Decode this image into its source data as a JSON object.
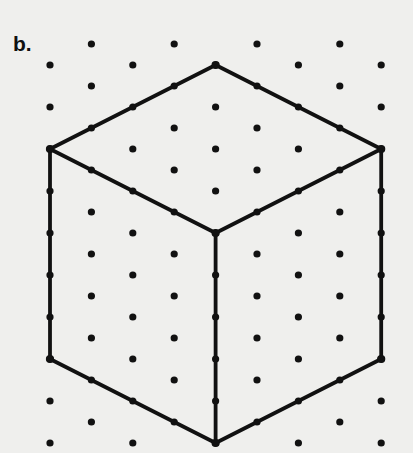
{
  "figure": {
    "panel_label": "b.",
    "caption_text": "",
    "background_color": "#efefed",
    "ink_color": "#111111",
    "dot_color": "#111111",
    "dot_radius": 3.6,
    "line_width": 3.8,
    "width": 413,
    "height": 453
  },
  "grid": {
    "type": "isometric-dot-lattice",
    "col_spacing": 82.8,
    "row_spacing": 42.0,
    "row_offset_even": 50,
    "row_offset_odd": 91.4,
    "first_row_y": 44,
    "row_count": 10,
    "cols_per_row": 5,
    "dots": [
      {
        "x": 91.4,
        "y": 44
      },
      {
        "x": 174.2,
        "y": 44
      },
      {
        "x": 257.0,
        "y": 44
      },
      {
        "x": 339.8,
        "y": 44
      },
      {
        "x": 50.0,
        "y": 65
      },
      {
        "x": 132.8,
        "y": 65
      },
      {
        "x": 215.6,
        "y": 65
      },
      {
        "x": 298.4,
        "y": 65
      },
      {
        "x": 381.2,
        "y": 65
      },
      {
        "x": 91.4,
        "y": 86
      },
      {
        "x": 174.2,
        "y": 86
      },
      {
        "x": 257.0,
        "y": 86
      },
      {
        "x": 339.8,
        "y": 86
      },
      {
        "x": 50.0,
        "y": 107
      },
      {
        "x": 132.8,
        "y": 107
      },
      {
        "x": 215.6,
        "y": 107
      },
      {
        "x": 298.4,
        "y": 107
      },
      {
        "x": 381.2,
        "y": 107
      },
      {
        "x": 91.4,
        "y": 128
      },
      {
        "x": 174.2,
        "y": 128
      },
      {
        "x": 257.0,
        "y": 128
      },
      {
        "x": 339.8,
        "y": 128
      },
      {
        "x": 50.0,
        "y": 149
      },
      {
        "x": 132.8,
        "y": 149
      },
      {
        "x": 215.6,
        "y": 149
      },
      {
        "x": 298.4,
        "y": 149
      },
      {
        "x": 381.2,
        "y": 149
      },
      {
        "x": 91.4,
        "y": 170
      },
      {
        "x": 174.2,
        "y": 170
      },
      {
        "x": 257.0,
        "y": 170
      },
      {
        "x": 339.8,
        "y": 170
      },
      {
        "x": 50.0,
        "y": 191
      },
      {
        "x": 132.8,
        "y": 191
      },
      {
        "x": 215.6,
        "y": 191
      },
      {
        "x": 298.4,
        "y": 191
      },
      {
        "x": 381.2,
        "y": 191
      },
      {
        "x": 91.4,
        "y": 212
      },
      {
        "x": 174.2,
        "y": 212
      },
      {
        "x": 257.0,
        "y": 212
      },
      {
        "x": 339.8,
        "y": 212
      },
      {
        "x": 50.0,
        "y": 233
      },
      {
        "x": 132.8,
        "y": 233
      },
      {
        "x": 215.6,
        "y": 233
      },
      {
        "x": 298.4,
        "y": 233
      },
      {
        "x": 381.2,
        "y": 233
      },
      {
        "x": 91.4,
        "y": 254
      },
      {
        "x": 174.2,
        "y": 254
      },
      {
        "x": 257.0,
        "y": 254
      },
      {
        "x": 339.8,
        "y": 254
      },
      {
        "x": 50.0,
        "y": 275
      },
      {
        "x": 132.8,
        "y": 275
      },
      {
        "x": 215.6,
        "y": 275
      },
      {
        "x": 298.4,
        "y": 275
      },
      {
        "x": 381.2,
        "y": 275
      },
      {
        "x": 91.4,
        "y": 296
      },
      {
        "x": 174.2,
        "y": 296
      },
      {
        "x": 257.0,
        "y": 296
      },
      {
        "x": 339.8,
        "y": 296
      },
      {
        "x": 50.0,
        "y": 317
      },
      {
        "x": 132.8,
        "y": 317
      },
      {
        "x": 215.6,
        "y": 317
      },
      {
        "x": 298.4,
        "y": 317
      },
      {
        "x": 381.2,
        "y": 317
      },
      {
        "x": 91.4,
        "y": 338
      },
      {
        "x": 174.2,
        "y": 338
      },
      {
        "x": 257.0,
        "y": 338
      },
      {
        "x": 339.8,
        "y": 338
      },
      {
        "x": 50.0,
        "y": 359
      },
      {
        "x": 132.8,
        "y": 359
      },
      {
        "x": 215.6,
        "y": 359
      },
      {
        "x": 298.4,
        "y": 359
      },
      {
        "x": 381.2,
        "y": 359
      },
      {
        "x": 91.4,
        "y": 380
      },
      {
        "x": 174.2,
        "y": 380
      },
      {
        "x": 257.0,
        "y": 380
      },
      {
        "x": 339.8,
        "y": 380
      },
      {
        "x": 50.0,
        "y": 401
      },
      {
        "x": 132.8,
        "y": 401
      },
      {
        "x": 215.6,
        "y": 401
      },
      {
        "x": 298.4,
        "y": 401
      },
      {
        "x": 381.2,
        "y": 401
      },
      {
        "x": 91.4,
        "y": 422
      },
      {
        "x": 174.2,
        "y": 422
      },
      {
        "x": 257.0,
        "y": 422
      },
      {
        "x": 339.8,
        "y": 422
      },
      {
        "x": 50.0,
        "y": 443
      },
      {
        "x": 132.8,
        "y": 443
      },
      {
        "x": 215.6,
        "y": 443
      },
      {
        "x": 298.4,
        "y": 443
      },
      {
        "x": 381.2,
        "y": 443
      }
    ]
  },
  "drawing": {
    "shape_name": "isometric-cube",
    "vertices": {
      "top": {
        "x": 215.6,
        "y": 65
      },
      "left": {
        "x": 50.0,
        "y": 149
      },
      "right": {
        "x": 381.2,
        "y": 149
      },
      "center": {
        "x": 215.6,
        "y": 233
      },
      "bottom_left": {
        "x": 50.0,
        "y": 359
      },
      "bottom_right": {
        "x": 381.2,
        "y": 359
      },
      "bottom": {
        "x": 215.6,
        "y": 443
      }
    },
    "edges": [
      {
        "name": "top-to-left",
        "from": "top",
        "to": "left"
      },
      {
        "name": "top-to-right",
        "from": "top",
        "to": "right"
      },
      {
        "name": "left-to-center",
        "from": "left",
        "to": "center"
      },
      {
        "name": "right-to-center",
        "from": "right",
        "to": "center"
      },
      {
        "name": "left-vertical",
        "from": "left",
        "to": "bottom_left"
      },
      {
        "name": "right-vertical",
        "from": "right",
        "to": "bottom_right"
      },
      {
        "name": "center-vertical",
        "from": "center",
        "to": "bottom"
      },
      {
        "name": "bottom-left-to-bottom",
        "from": "bottom_left",
        "to": "bottom"
      },
      {
        "name": "bottom-right-to-bottom",
        "from": "bottom_right",
        "to": "bottom"
      }
    ]
  }
}
